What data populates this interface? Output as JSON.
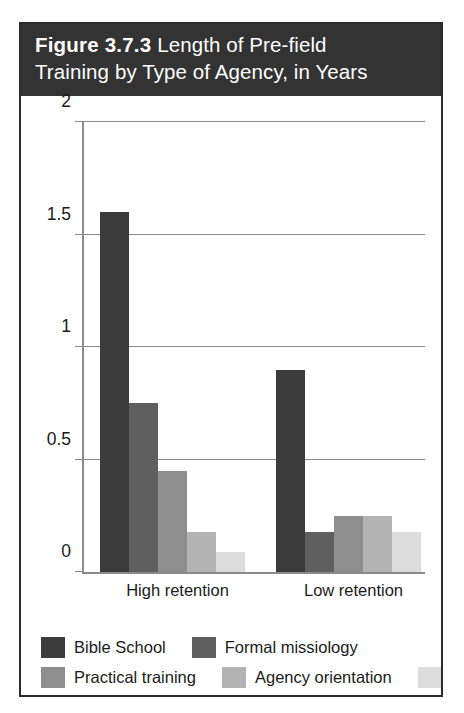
{
  "figure": {
    "title_label": "Figure 3.7.3",
    "title_rest": " Length of Pre-field",
    "title_line2": "Training by Type of Agency, in Years"
  },
  "chart_data": {
    "type": "bar",
    "title": "Figure 3.7.3 Length of Pre-field Training by Type of Agency, in Years",
    "xlabel": "",
    "ylabel": "",
    "ylim": [
      0,
      2
    ],
    "yticks": [
      "0",
      "0.5",
      "1",
      "1.5",
      "2"
    ],
    "ytick_values": [
      0,
      0.5,
      1,
      1.5,
      2
    ],
    "grid": true,
    "legend_position": "bottom",
    "categories": [
      "High retention",
      "Low retention"
    ],
    "series": [
      {
        "name": "Bible School",
        "color": "#3b3b3b",
        "values": [
          1.6,
          0.9
        ]
      },
      {
        "name": "Formal missiology",
        "color": "#5e5e5e",
        "values": [
          0.75,
          0.18
        ]
      },
      {
        "name": "Practical training",
        "color": "#8e8e8e",
        "values": [
          0.45,
          0.25
        ]
      },
      {
        "name": "Agency orientation",
        "color": "#b3b3b3",
        "values": [
          0.18,
          0.25
        ]
      },
      {
        "name": "Intern",
        "color": "#dcdcdc",
        "values": [
          0.09,
          0.18
        ]
      }
    ]
  },
  "axis": {
    "tick_0": "0",
    "tick_1": "0.5",
    "tick_2": "1",
    "tick_3": "1.5",
    "tick_4": "2",
    "group_high": "High retention",
    "group_low": "Low retention"
  },
  "legend": {
    "items": [
      {
        "label": "Bible School"
      },
      {
        "label": "Formal missiology"
      },
      {
        "label": "Practical training"
      },
      {
        "label": "Agency orientation"
      },
      {
        "label": "Intern"
      }
    ]
  },
  "colors": {
    "banner": "#333333",
    "frame": "#2b2b2b",
    "axis": "#8a8a8a",
    "text": "#1b1b1b"
  }
}
